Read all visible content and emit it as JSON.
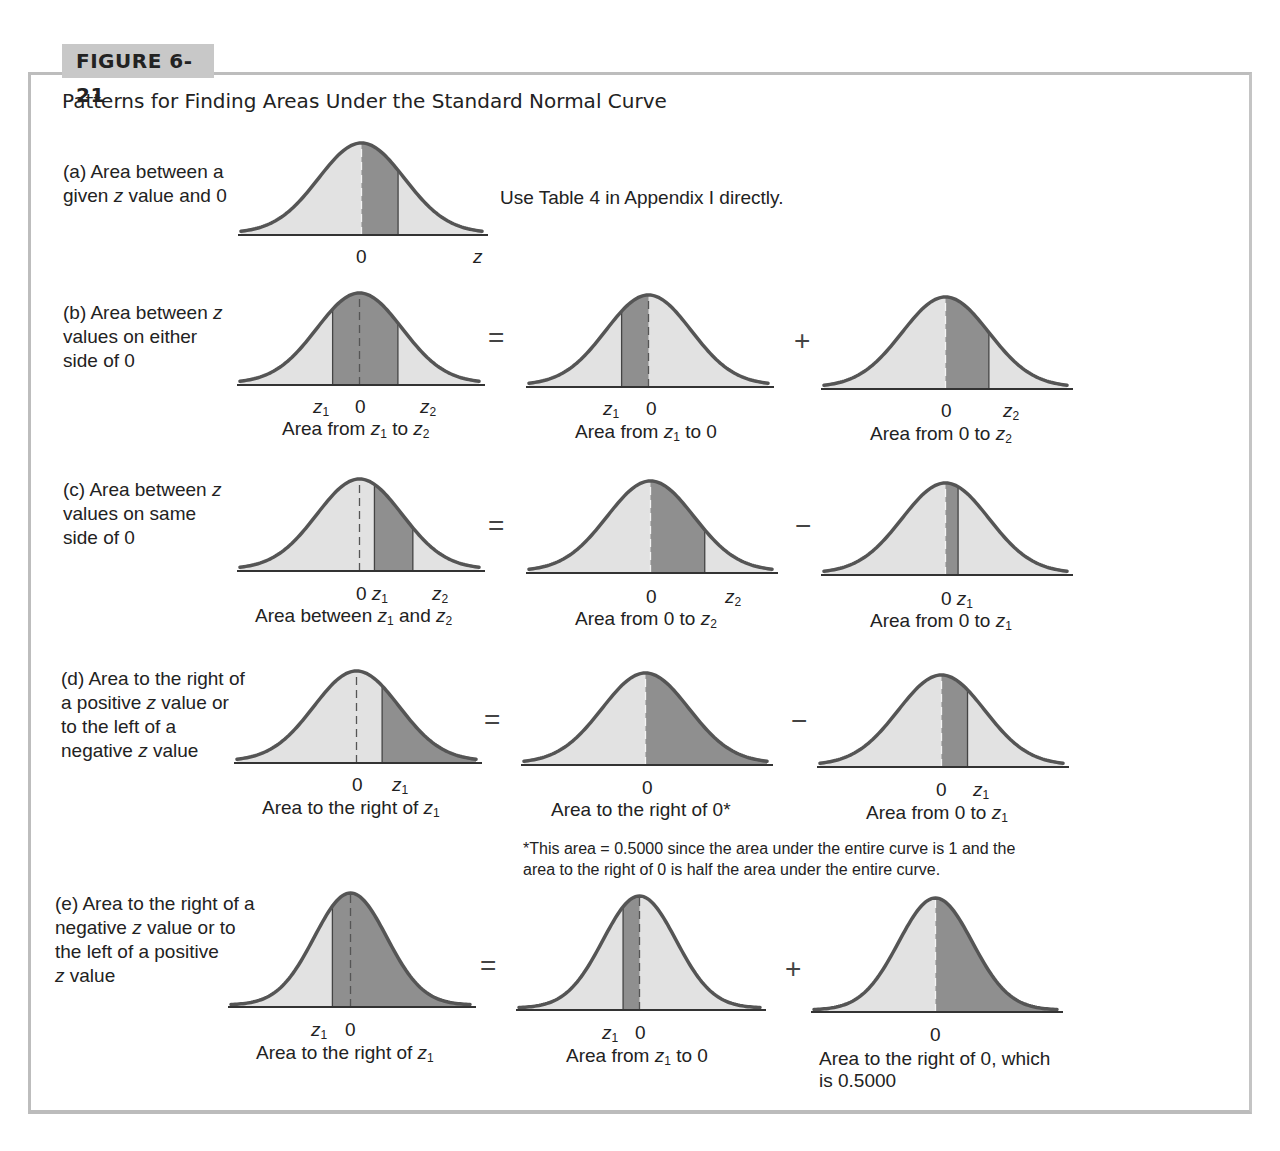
{
  "figure": {
    "label": "FIGURE 6-21",
    "title": "Patterns for Finding Areas Under the Standard Normal Curve"
  },
  "colors": {
    "light_fill": "#e2e2e2",
    "dark_fill": "#8f8f8f",
    "curve_stroke": "#555555",
    "frame": "#bdbdbd",
    "tab_bg": "#c8c8c8"
  },
  "rows": {
    "a": {
      "desc": [
        "(a) Area between a",
        "given z value and 0"
      ],
      "instruction": "Use Table 4 in Appendix I directly.",
      "curve": {
        "ticks": [
          "0",
          "z"
        ]
      }
    },
    "b": {
      "desc": [
        "(b) Area between z",
        "values on either",
        "side of 0"
      ],
      "op1": "=",
      "op2": "+",
      "curves": [
        {
          "ticks": [
            "z1",
            "0",
            "z2"
          ],
          "caption": "Area from z1 to z2"
        },
        {
          "ticks": [
            "z1",
            "0"
          ],
          "caption": "Area from z1 to 0"
        },
        {
          "ticks": [
            "0",
            "z2"
          ],
          "caption": "Area from 0 to z2"
        }
      ]
    },
    "c": {
      "desc": [
        "(c) Area between z",
        "values on same",
        "side of 0"
      ],
      "op1": "=",
      "op2": "−",
      "curves": [
        {
          "ticks": [
            "0",
            "z1",
            "z2"
          ],
          "caption": "Area between z1 and z2"
        },
        {
          "ticks": [
            "0",
            "z2"
          ],
          "caption": "Area from 0 to z2"
        },
        {
          "ticks": [
            "0",
            "z1"
          ],
          "caption": "Area from 0 to z1"
        }
      ]
    },
    "d": {
      "desc": [
        "(d) Area to the right of",
        "a positive z value or",
        "to the left of a",
        "negative z value"
      ],
      "op1": "=",
      "op2": "−",
      "curves": [
        {
          "ticks": [
            "0",
            "z1"
          ],
          "caption": "Area to the right of z1"
        },
        {
          "ticks": [
            "0"
          ],
          "caption": "Area to the right of 0*"
        },
        {
          "ticks": [
            "0",
            "z1"
          ],
          "caption": "Area from 0 to z1"
        }
      ],
      "footnote": [
        "*This area = 0.5000 since the area under the entire curve is 1 and the",
        "area to the right of 0 is half the area under the entire curve."
      ]
    },
    "e": {
      "desc": [
        "(e) Area to the right of a",
        "negative z value or to",
        "the left of a positive",
        "z value"
      ],
      "op1": "=",
      "op2": "+",
      "curves": [
        {
          "ticks": [
            "z1",
            "0"
          ],
          "caption": "Area to the right of z1"
        },
        {
          "ticks": [
            "z1",
            "0"
          ],
          "caption": "Area from z1 to 0"
        },
        {
          "ticks": [
            "0"
          ],
          "caption": [
            "Area to the right of 0, which",
            "is 0.5000"
          ]
        }
      ]
    }
  },
  "text": {
    "zero": "0",
    "z": "z",
    "sub1": "1",
    "sub2": "2",
    "area_from": "Area from ",
    "to": " to ",
    "to0": " to 0",
    "area_from0to": "Area from 0 to ",
    "area_between": "Area between ",
    "and": " and ",
    "right_of": "Area to the right of ",
    "right_of0": "Area to the right of 0*"
  }
}
